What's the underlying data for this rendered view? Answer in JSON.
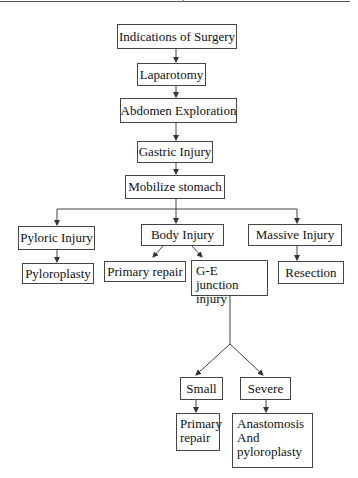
{
  "diagram": {
    "type": "flowchart",
    "nodes": {
      "indications": "Indications of Surgery",
      "laparotomy": "Laparotomy",
      "exploration": "Abdomen Exploration",
      "gastric": "Gastric Injury",
      "mobilize": "Mobilize stomach",
      "pyloric": "Pyloric Injury",
      "pyloroplasty": "Pyloroplasty",
      "body": "Body Injury",
      "primary_repair_1": "Primary repair",
      "ge_line1": "G-E junction",
      "ge_line2": "injury",
      "massive": "Massive Injury",
      "resection": "Resection",
      "small": "Small",
      "severe": "Severe",
      "primary_repair_2_line1": "Primary",
      "primary_repair_2_line2": "repair",
      "anastomosis_line1": "Anastomosis",
      "anastomosis_line2": "And",
      "anastomosis_line3": "pyloroplasty"
    },
    "edges": [
      [
        "Indications of Surgery",
        "Laparotomy"
      ],
      [
        "Laparotomy",
        "Abdomen Exploration"
      ],
      [
        "Abdomen Exploration",
        "Gastric Injury"
      ],
      [
        "Gastric Injury",
        "Mobilize stomach"
      ],
      [
        "Mobilize stomach",
        "Pyloric Injury"
      ],
      [
        "Mobilize stomach",
        "Body Injury"
      ],
      [
        "Mobilize stomach",
        "Massive Injury"
      ],
      [
        "Pyloric Injury",
        "Pyloroplasty"
      ],
      [
        "Body Injury",
        "Primary repair"
      ],
      [
        "Body Injury",
        "G-E junction injury"
      ],
      [
        "Massive Injury",
        "Resection"
      ],
      [
        "G-E junction injury",
        "Small"
      ],
      [
        "G-E junction injury",
        "Severe"
      ],
      [
        "Small",
        "Primary repair"
      ],
      [
        "Severe",
        "Anastomosis And pyloroplasty"
      ]
    ],
    "colors": {
      "line": "#444444",
      "background": "#ffffff",
      "text": "#111111"
    }
  }
}
